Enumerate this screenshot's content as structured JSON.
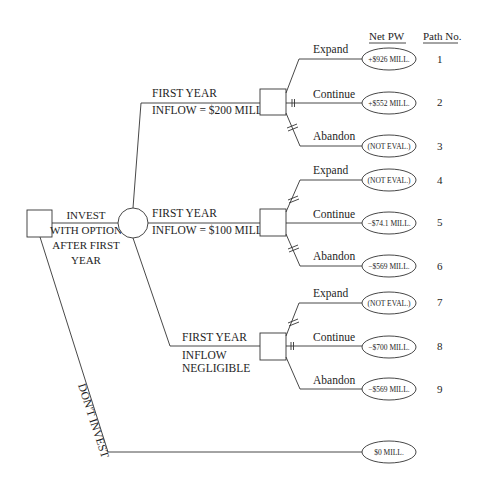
{
  "header": {
    "net_pw": "Net PW",
    "path_no": "Path No."
  },
  "root": {
    "invest_label": [
      "INVEST",
      "WITH OPTION",
      "AFTER FIRST",
      "YEAR"
    ],
    "dont_invest_label": "DON'T INVEST"
  },
  "branches": [
    {
      "label_line1": "FIRST YEAR",
      "label_line2": "INFLOW = $200 MILL.",
      "options": [
        {
          "name": "Expand",
          "value": "+$926 MILL.",
          "path": "1",
          "blocked": false
        },
        {
          "name": "Continue",
          "value": "+$552 MILL.",
          "path": "2",
          "blocked": true
        },
        {
          "name": "Abandon",
          "value": "(NOT EVAL.)",
          "path": "3",
          "blocked": true
        }
      ]
    },
    {
      "label_line1": "FIRST YEAR",
      "label_line2": "INFLOW = $100 MILL.",
      "options": [
        {
          "name": "Expand",
          "value": "(NOT EVAL.)",
          "path": "4",
          "blocked": true
        },
        {
          "name": "Continue",
          "value": "−$74.1 MILL.",
          "path": "5",
          "blocked": false
        },
        {
          "name": "Abandon",
          "value": "−$569 MILL.",
          "path": "6",
          "blocked": true
        }
      ]
    },
    {
      "label_line1": "FIRST YEAR",
      "label_line2": "INFLOW",
      "label_line3": "NEGLIGIBLE",
      "options": [
        {
          "name": "Expand",
          "value": "(NOT EVAL.)",
          "path": "7",
          "blocked": true
        },
        {
          "name": "Continue",
          "value": "−$700 MILL.",
          "path": "8",
          "blocked": true
        },
        {
          "name": "Abandon",
          "value": "−$569 MILL.",
          "path": "9",
          "blocked": false
        }
      ]
    }
  ],
  "dont_invest": {
    "value": "$0 MILL."
  }
}
